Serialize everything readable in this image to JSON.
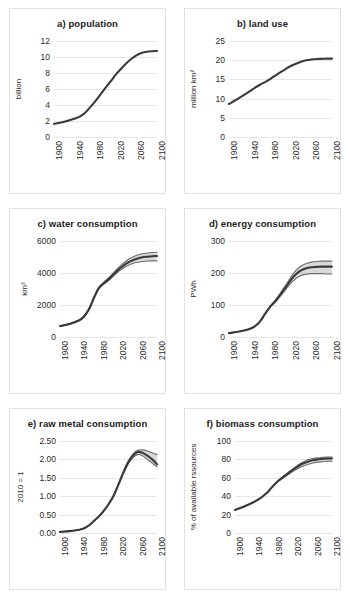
{
  "figure": {
    "name": "global-resource-projections-figure",
    "background": "#ffffff",
    "panel_border_color": "#e2e2e2",
    "line_color": "#3a3a3a",
    "grid_color": "#e6e6e6"
  },
  "chart_data": [
    {
      "type": "line",
      "panel": "a",
      "title": "a) population",
      "xlabel": "",
      "ylabel": "billion",
      "xlim": [
        1900,
        2100
      ],
      "ylim": [
        0,
        12
      ],
      "yticks": [
        0,
        2,
        4,
        6,
        8,
        10,
        12
      ],
      "ytick_labels": [
        "0",
        "2",
        "4",
        "6",
        "8",
        "10",
        "12"
      ],
      "xticks": [
        1900,
        1940,
        1980,
        2020,
        2060,
        2100
      ],
      "xtick_labels": [
        "1900",
        "1940",
        "1980",
        "2020",
        "2060",
        "2100"
      ],
      "grid": true,
      "legend": "none",
      "x": [
        1900,
        1920,
        1940,
        1950,
        1960,
        1970,
        1980,
        1990,
        2000,
        2010,
        2020,
        2030,
        2040,
        2050,
        2060,
        2070,
        2080,
        2090,
        2100
      ],
      "series": [
        {
          "name": "population",
          "values": [
            1.65,
            1.9,
            2.3,
            2.55,
            3.0,
            3.7,
            4.45,
            5.3,
            6.15,
            6.95,
            7.8,
            8.5,
            9.2,
            9.75,
            10.2,
            10.5,
            10.65,
            10.72,
            10.75
          ]
        }
      ]
    },
    {
      "type": "line",
      "panel": "b",
      "title": "b) land use",
      "xlabel": "",
      "ylabel": "million km²",
      "xlim": [
        1900,
        2100
      ],
      "ylim": [
        0,
        25
      ],
      "yticks": [
        0,
        5,
        10,
        15,
        20,
        25
      ],
      "ytick_labels": [
        "0",
        "5",
        "10",
        "15",
        "20",
        "25"
      ],
      "xticks": [
        1900,
        1940,
        1980,
        2020,
        2060,
        2100
      ],
      "xtick_labels": [
        "1900",
        "1940",
        "1980",
        "2020",
        "2060",
        "2100"
      ],
      "grid": true,
      "legend": "none",
      "x": [
        1900,
        1920,
        1940,
        1950,
        1960,
        1970,
        1980,
        1990,
        2000,
        2010,
        2020,
        2030,
        2040,
        2050,
        2060,
        2070,
        2080,
        2090,
        2100
      ],
      "series": [
        {
          "name": "land use",
          "values": [
            8.6,
            10.2,
            11.9,
            12.8,
            13.6,
            14.3,
            15.1,
            16.0,
            16.9,
            17.7,
            18.5,
            19.1,
            19.6,
            20.0,
            20.2,
            20.3,
            20.35,
            20.4,
            20.4
          ]
        }
      ]
    },
    {
      "type": "line",
      "panel": "c",
      "title": "c) water consumption",
      "xlabel": "",
      "ylabel": "km³",
      "xlim": [
        1900,
        2100
      ],
      "ylim": [
        0,
        6000
      ],
      "yticks": [
        0,
        2000,
        4000,
        6000
      ],
      "ytick_labels": [
        "0",
        "2000",
        "4000",
        "6000"
      ],
      "xticks": [
        1900,
        1940,
        1980,
        2020,
        2060,
        2100
      ],
      "xtick_labels": [
        "1900",
        "1940",
        "1980",
        "2020",
        "2060",
        "2100"
      ],
      "grid": true,
      "legend": "none",
      "uncertainty_band": true,
      "x": [
        1900,
        1920,
        1940,
        1950,
        1960,
        1970,
        1980,
        1990,
        2000,
        2010,
        2020,
        2030,
        2040,
        2050,
        2060,
        2070,
        2080,
        2090,
        2100
      ],
      "series": [
        {
          "name": "water consumption (central)",
          "values": [
            680,
            820,
            1050,
            1300,
            1750,
            2450,
            3050,
            3350,
            3600,
            3900,
            4200,
            4450,
            4650,
            4800,
            4900,
            4980,
            5020,
            5050,
            5060
          ]
        },
        {
          "name": "water consumption (upper)",
          "values": [
            700,
            845,
            1085,
            1340,
            1800,
            2500,
            3100,
            3420,
            3690,
            4000,
            4320,
            4600,
            4830,
            5000,
            5120,
            5200,
            5250,
            5280,
            5300
          ]
        },
        {
          "name": "water consumption (lower)",
          "values": [
            665,
            800,
            1025,
            1265,
            1700,
            2400,
            3000,
            3290,
            3520,
            3800,
            4080,
            4300,
            4470,
            4590,
            4670,
            4720,
            4750,
            4760,
            4760
          ]
        }
      ]
    },
    {
      "type": "line",
      "panel": "d",
      "title": "d) energy consumption",
      "xlabel": "",
      "ylabel": "PWh",
      "xlim": [
        1900,
        2100
      ],
      "ylim": [
        0,
        300
      ],
      "yticks": [
        0,
        100,
        200,
        300
      ],
      "ytick_labels": [
        "0",
        "100",
        "200",
        "300"
      ],
      "xticks": [
        1900,
        1940,
        1980,
        2020,
        2060,
        2100
      ],
      "xtick_labels": [
        "1900",
        "1940",
        "1980",
        "2020",
        "2060",
        "2100"
      ],
      "grid": true,
      "legend": "none",
      "uncertainty_band": true,
      "x": [
        1900,
        1920,
        1940,
        1950,
        1960,
        1970,
        1980,
        1990,
        2000,
        2010,
        2020,
        2030,
        2040,
        2050,
        2060,
        2070,
        2080,
        2090,
        2100
      ],
      "series": [
        {
          "name": "energy consumption (central)",
          "values": [
            12,
            17,
            25,
            33,
            48,
            72,
            95,
            112,
            133,
            155,
            178,
            196,
            208,
            215,
            218,
            219,
            220,
            220,
            220
          ]
        },
        {
          "name": "energy consumption (upper)",
          "values": [
            12,
            17,
            25,
            33,
            48,
            73,
            97,
            115,
            138,
            162,
            187,
            208,
            222,
            230,
            234,
            236,
            237,
            237,
            237
          ]
        },
        {
          "name": "energy consumption (lower)",
          "values": [
            12,
            17,
            25,
            33,
            47,
            71,
            93,
            109,
            128,
            148,
            168,
            183,
            192,
            196,
            198,
            198,
            198,
            197,
            197
          ]
        }
      ]
    },
    {
      "type": "line",
      "panel": "e",
      "title": "e) raw metal consumption",
      "xlabel": "",
      "ylabel": "2010 = 1",
      "xlim": [
        1900,
        2100
      ],
      "ylim": [
        0.0,
        2.5
      ],
      "yticks": [
        0.0,
        0.5,
        1.0,
        1.5,
        2.0,
        2.5
      ],
      "ytick_labels": [
        "0.00",
        "0.50",
        "1.00",
        "1.50",
        "2.00",
        "2.50"
      ],
      "xticks": [
        1900,
        1940,
        1980,
        2020,
        2060,
        2100
      ],
      "xtick_labels": [
        "1900",
        "1940",
        "1980",
        "2020",
        "2060",
        "2100"
      ],
      "grid": true,
      "legend": "none",
      "uncertainty_band": true,
      "x": [
        1900,
        1920,
        1940,
        1950,
        1960,
        1970,
        1980,
        1990,
        2000,
        2010,
        2020,
        2030,
        2040,
        2050,
        2060,
        2070,
        2080,
        2090,
        2100
      ],
      "series": [
        {
          "name": "raw metal consumption (central)",
          "values": [
            0.03,
            0.05,
            0.09,
            0.13,
            0.21,
            0.33,
            0.45,
            0.6,
            0.78,
            1.0,
            1.3,
            1.62,
            1.9,
            2.1,
            2.2,
            2.18,
            2.1,
            2.0,
            1.87
          ]
        },
        {
          "name": "raw metal consumption (upper)",
          "values": [
            0.03,
            0.05,
            0.09,
            0.13,
            0.21,
            0.33,
            0.45,
            0.6,
            0.79,
            1.01,
            1.32,
            1.65,
            1.94,
            2.14,
            2.25,
            2.26,
            2.23,
            2.18,
            2.13
          ]
        },
        {
          "name": "raw metal consumption (lower)",
          "values": [
            0.03,
            0.05,
            0.09,
            0.13,
            0.2,
            0.32,
            0.44,
            0.59,
            0.77,
            0.99,
            1.28,
            1.59,
            1.86,
            2.04,
            2.13,
            2.1,
            2.0,
            1.9,
            1.8
          ]
        }
      ]
    },
    {
      "type": "line",
      "panel": "f",
      "title": "f) biomass consumption",
      "xlabel": "",
      "ylabel": "% of available rssources",
      "xlim": [
        1900,
        2100
      ],
      "ylim": [
        0,
        100
      ],
      "yticks": [
        0,
        20,
        40,
        60,
        80,
        100
      ],
      "ytick_labels": [
        "0",
        "20",
        "40",
        "60",
        "80",
        "100"
      ],
      "xticks": [
        1900,
        1940,
        1980,
        2020,
        2060,
        2100
      ],
      "xtick_labels": [
        "1900",
        "1940",
        "1980",
        "2020",
        "2060",
        "2100"
      ],
      "grid": true,
      "legend": "none",
      "uncertainty_band": true,
      "x": [
        1900,
        1920,
        1940,
        1950,
        1960,
        1970,
        1980,
        1990,
        2000,
        2010,
        2020,
        2030,
        2040,
        2050,
        2060,
        2070,
        2080,
        2090,
        2100
      ],
      "series": [
        {
          "name": "biomass consumption (central)",
          "values": [
            25,
            29,
            34,
            37,
            41,
            46,
            52,
            57,
            61,
            65,
            69,
            72.5,
            75.5,
            77.5,
            79,
            80,
            80.5,
            81,
            81
          ]
        },
        {
          "name": "biomass consumption (upper)",
          "values": [
            25,
            29,
            34,
            37,
            41,
            46,
            52,
            57.5,
            62,
            66,
            70,
            74,
            77,
            79.5,
            81,
            81.8,
            82.2,
            82.5,
            82.5
          ]
        },
        {
          "name": "biomass consumption (lower)",
          "values": [
            25,
            29,
            34,
            37,
            41,
            46,
            51.5,
            56.5,
            60,
            63.5,
            67,
            70,
            72.5,
            74.5,
            76,
            77,
            77.5,
            78,
            78
          ]
        }
      ]
    }
  ]
}
